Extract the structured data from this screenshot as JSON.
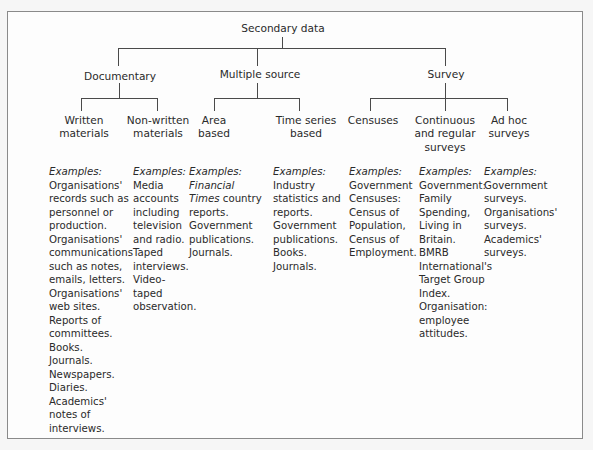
{
  "diagram": {
    "root": "Secondary data",
    "branches": [
      {
        "label": "Documentary",
        "children": [
          {
            "label": "Written\nmaterials"
          },
          {
            "label": "Non-written\nmaterials"
          }
        ]
      },
      {
        "label": "Multiple source",
        "children": [
          {
            "label": "Area\nbased"
          },
          {
            "label": "Time series\nbased"
          }
        ]
      },
      {
        "label": "Survey",
        "children": [
          {
            "label": "Censuses"
          },
          {
            "label": "Continuous\nand regular\nsurveys"
          },
          {
            "label": "Ad hoc\nsurveys"
          }
        ]
      }
    ],
    "examples_label": "Examples:",
    "examples": [
      "Organisations'\nrecords such as\npersonnel or\nproduction.\nOrganisations'\ncommunications\nsuch as notes,\nemails, letters.\nOrganisations'\nweb sites.\nReports of\ncommittees.\nBooks.\nJournals.\nNewspapers.\nDiaries.\nAcademics'\nnotes of\ninterviews.",
      "Media\naccounts\nincluding\ntelevision\nand radio.\nTaped\ninterviews.\nVideo-\ntaped\nobservation.",
      {
        "italic_part": "Financial\nTimes",
        "rest": " country\nreports.\nGovernment\npublications.\nJournals."
      },
      "Industry\nstatistics and\nreports.\nGovernment\npublications.\nBooks.\nJournals.",
      "Government\nCensuses:\nCensus of\nPopulation,\nCensus of\nEmployment.",
      "Government:\nFamily\nSpending,\nLiving in\nBritain.\nBMRB\nInternational's\nTarget Group\nIndex.\nOrganisation:\nemployee\nattitudes.",
      "Government\nsurveys.\nOrganisations'\nsurveys.\nAcademics'\nsurveys."
    ]
  }
}
